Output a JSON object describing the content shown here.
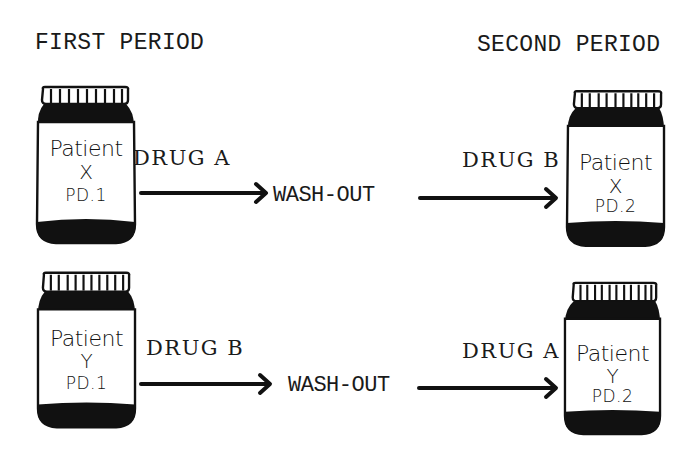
{
  "diagram": {
    "type": "crossover-study-design",
    "colors": {
      "ink": "#111111",
      "background": "#ffffff"
    },
    "headers": {
      "first_period": "FIRST PERIOD",
      "second_period": "SECOND PERIOD"
    },
    "rows": [
      {
        "patient": "X",
        "first": {
          "bottle": {
            "line1": "Patient",
            "line2": "X",
            "line3": "PD.1"
          },
          "drug": "DRUG A"
        },
        "washout": "WASH-OUT",
        "second": {
          "drug": "DRUG B",
          "bottle": {
            "line1": "Patient",
            "line2": "X",
            "line3": "PD.2"
          }
        }
      },
      {
        "patient": "Y",
        "first": {
          "bottle": {
            "line1": "Patient",
            "line2": "Y",
            "line3": "PD.1"
          },
          "drug": "DRUG B"
        },
        "washout": "WASH-OUT",
        "second": {
          "drug": "DRUG A",
          "bottle": {
            "line1": "Patient",
            "line2": "Y",
            "line3": "PD.2"
          }
        }
      }
    ],
    "icons": {
      "bottle": "medicine-bottle-icon",
      "arrow": "arrow-right-icon"
    }
  }
}
